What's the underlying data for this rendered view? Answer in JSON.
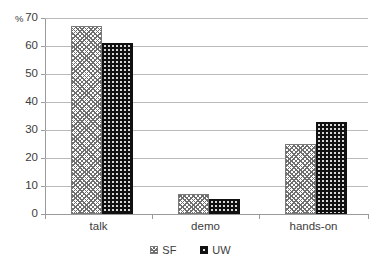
{
  "chart_data": {
    "type": "bar",
    "title": "",
    "xlabel": "",
    "ylabel": "%",
    "ylim": [
      0,
      70
    ],
    "yticks": [
      0,
      10,
      20,
      30,
      40,
      50,
      60,
      70
    ],
    "grid": true,
    "legend_position": "bottom-center",
    "categories": [
      "talk",
      "demo",
      "hands-on"
    ],
    "series": [
      {
        "name": "SF",
        "values": [
          67,
          7,
          25
        ],
        "pattern": "light-checker",
        "color": "#ffffff"
      },
      {
        "name": "UW",
        "values": [
          61,
          5.5,
          33
        ],
        "pattern": "dark-dotted",
        "color": "#111111"
      }
    ]
  },
  "axis": {
    "unit_label": "%",
    "tick_labels": [
      "70",
      "60",
      "50",
      "40",
      "30",
      "20",
      "10",
      "0"
    ]
  },
  "categories": [
    {
      "label": "talk"
    },
    {
      "label": "demo"
    },
    {
      "label": "hands-on"
    }
  ],
  "legend": {
    "items": [
      {
        "label": "SF",
        "swatch": "sf-pattern-swatch"
      },
      {
        "label": "UW",
        "swatch": "uw-pattern-swatch"
      }
    ]
  },
  "colors": {
    "gridline": "#b9b9b9",
    "axis": "#9a9a9a",
    "text": "#3c3c3c",
    "series_uw": "#111111",
    "series_sf": "#ffffff"
  }
}
